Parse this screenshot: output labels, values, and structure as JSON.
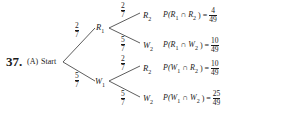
{
  "problem": {
    "number": "37.",
    "part": "(A)",
    "root_label": "Start"
  },
  "level1": [
    {
      "node": "R",
      "sub": "1",
      "prob_num": "2",
      "prob_den": "7"
    },
    {
      "node": "W",
      "sub": "1",
      "prob_num": "5",
      "prob_den": "7"
    }
  ],
  "level2": [
    {
      "node": "R",
      "sub": "2",
      "prob_num": "2",
      "prob_den": "7",
      "event": "P(R",
      "event_sub1": "1",
      "event_mid": " ∩ R",
      "event_sub2": "2",
      "event_end": ") =",
      "result_num": "4",
      "result_den": "49"
    },
    {
      "node": "W",
      "sub": "2",
      "prob_num": "5",
      "prob_den": "7",
      "event": "P(R",
      "event_sub1": "1",
      "event_mid": " ∩ W",
      "event_sub2": "2",
      "event_end": ") =",
      "result_num": "10",
      "result_den": "49"
    },
    {
      "node": "R",
      "sub": "2",
      "prob_num": "2",
      "prob_den": "7",
      "event": "P(W",
      "event_sub1": "1",
      "event_mid": " ∩ R",
      "event_sub2": "2",
      "event_end": ") =",
      "result_num": "10",
      "result_den": "49"
    },
    {
      "node": "W",
      "sub": "2",
      "prob_num": "5",
      "prob_den": "7",
      "event": "P(W",
      "event_sub1": "1",
      "event_mid": " ∩ W",
      "event_sub2": "2",
      "event_end": ") =",
      "result_num": "25",
      "result_den": "49"
    }
  ]
}
